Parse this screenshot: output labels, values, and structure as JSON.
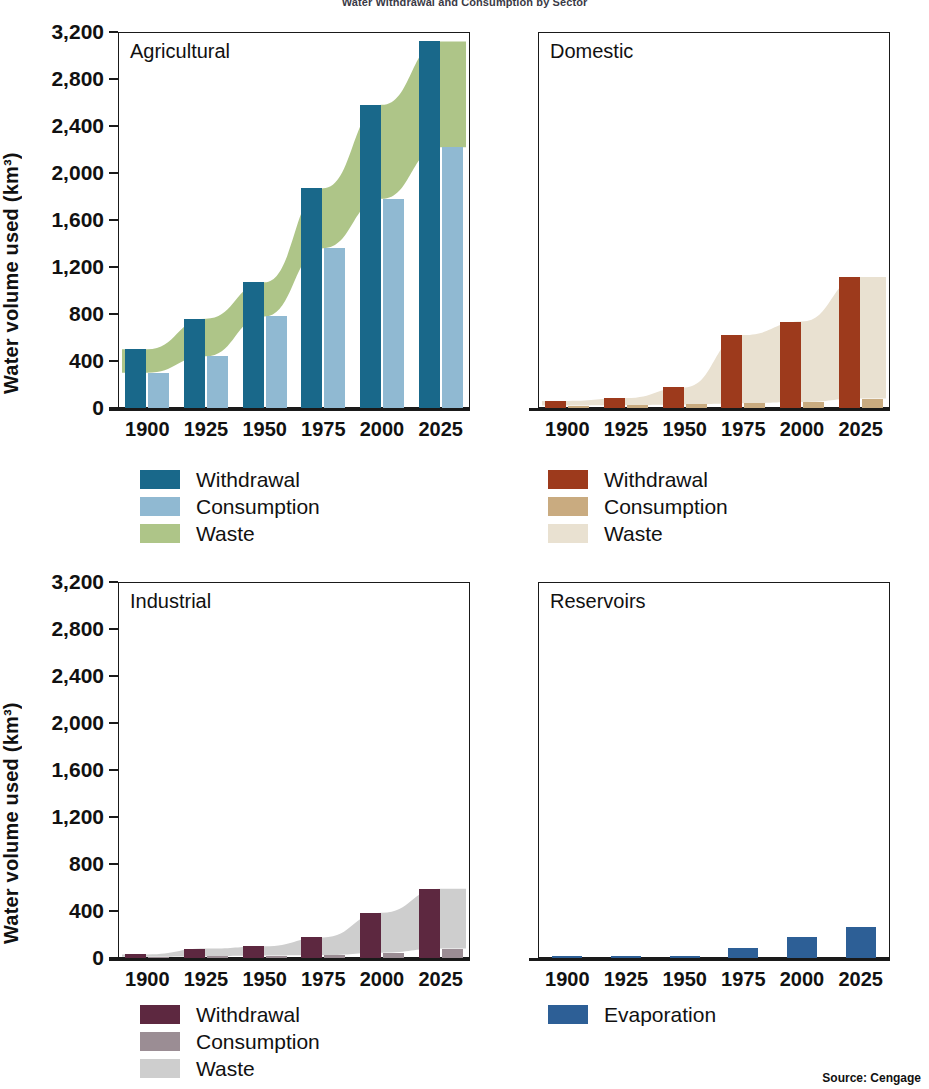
{
  "figure": {
    "title": "Water Withdrawal and Consumption by Sector",
    "source": "Source: Cengage",
    "y_axis_title": "Water volume used (km³)",
    "y_ticks": [
      "0",
      "400",
      "800",
      "1,200",
      "1,600",
      "2,000",
      "2,400",
      "2,800",
      "3,200"
    ],
    "x_ticks": [
      "1900",
      "1925",
      "1950",
      "1975",
      "2000",
      "2025"
    ]
  },
  "colors": {
    "agricultural_withdrawal": "#19688a",
    "agricultural_consumption": "#90b9d2",
    "agricultural_waste": "#aec588",
    "domestic_withdrawal": "#9d3a1c",
    "domestic_consumption": "#c9ab80",
    "domestic_waste": "#e9e1d1",
    "industrial_withdrawal": "#5d2840",
    "industrial_consumption": "#9b8d94",
    "industrial_waste": "#cecece",
    "reservoirs_evaporation": "#2d5f96",
    "axis": "#1a1a1a"
  },
  "panels": [
    {
      "id": "agricultural",
      "label": "Agricultural",
      "legend": [
        {
          "name": "withdrawal",
          "label": "Withdrawal",
          "color": "#19688a"
        },
        {
          "name": "consumption",
          "label": "Consumption",
          "color": "#90b9d2"
        },
        {
          "name": "waste",
          "label": "Waste",
          "color": "#aec588"
        }
      ]
    },
    {
      "id": "domestic",
      "label": "Domestic",
      "legend": [
        {
          "name": "withdrawal",
          "label": "Withdrawal",
          "color": "#9d3a1c"
        },
        {
          "name": "consumption",
          "label": "Consumption",
          "color": "#c9ab80"
        },
        {
          "name": "waste",
          "label": "Waste",
          "color": "#e9e1d1"
        }
      ]
    },
    {
      "id": "industrial",
      "label": "Industrial",
      "legend": [
        {
          "name": "withdrawal",
          "label": "Withdrawal",
          "color": "#5d2840"
        },
        {
          "name": "consumption",
          "label": "Consumption",
          "color": "#9b8d94"
        },
        {
          "name": "waste",
          "label": "Waste",
          "color": "#cecece"
        }
      ]
    },
    {
      "id": "reservoirs",
      "label": "Reservoirs",
      "legend": [
        {
          "name": "evaporation",
          "label": "Evaporation",
          "color": "#2d5f96"
        }
      ]
    }
  ],
  "chart_data": [
    {
      "type": "bar",
      "title": "Agricultural",
      "xlabel": "",
      "ylabel": "Water volume used (km³)",
      "ylim": [
        0,
        3200
      ],
      "grid": false,
      "legend_position": "below",
      "categories": [
        "1900",
        "1925",
        "1950",
        "1975",
        "2000",
        "2025"
      ],
      "series": [
        {
          "name": "Withdrawal",
          "color": "#19688a",
          "values": [
            500,
            760,
            1070,
            1870,
            2580,
            3120
          ]
        },
        {
          "name": "Consumption",
          "color": "#90b9d2",
          "values": [
            300,
            440,
            780,
            1360,
            1780,
            2220
          ]
        },
        {
          "name": "Waste",
          "color": "#aec588",
          "values": [
            200,
            320,
            290,
            510,
            800,
            900
          ],
          "render": "band",
          "band_upper": [
            500,
            760,
            1070,
            1870,
            2580,
            3120
          ],
          "band_lower": [
            300,
            440,
            780,
            1360,
            1780,
            2220
          ]
        }
      ]
    },
    {
      "type": "bar",
      "title": "Domestic",
      "xlabel": "",
      "ylabel": "Water volume used (km³)",
      "ylim": [
        0,
        3200
      ],
      "grid": false,
      "legend_position": "below",
      "categories": [
        "1900",
        "1925",
        "1950",
        "1975",
        "2000",
        "2025"
      ],
      "series": [
        {
          "name": "Withdrawal",
          "color": "#9d3a1c",
          "values": [
            60,
            85,
            175,
            620,
            735,
            1115
          ]
        },
        {
          "name": "Consumption",
          "color": "#c9ab80",
          "values": [
            20,
            25,
            30,
            40,
            50,
            80
          ]
        },
        {
          "name": "Waste",
          "color": "#e9e1d1",
          "values": [
            40,
            60,
            145,
            580,
            685,
            1035
          ],
          "render": "band",
          "band_upper": [
            60,
            85,
            175,
            620,
            735,
            1115
          ],
          "band_lower": [
            20,
            25,
            30,
            40,
            50,
            80
          ]
        }
      ]
    },
    {
      "type": "bar",
      "title": "Industrial",
      "xlabel": "",
      "ylabel": "Water volume used (km³)",
      "ylim": [
        0,
        3200
      ],
      "grid": false,
      "legend_position": "below",
      "categories": [
        "1900",
        "1925",
        "1950",
        "1975",
        "2000",
        "2025"
      ],
      "series": [
        {
          "name": "Withdrawal",
          "color": "#5d2840",
          "values": [
            30,
            80,
            100,
            175,
            385,
            590
          ]
        },
        {
          "name": "Consumption",
          "color": "#9b8d94",
          "values": [
            10,
            15,
            20,
            25,
            45,
            80
          ]
        },
        {
          "name": "Waste",
          "color": "#cecece",
          "values": [
            20,
            65,
            80,
            150,
            340,
            510
          ],
          "render": "band",
          "band_upper": [
            30,
            80,
            100,
            175,
            385,
            590
          ],
          "band_lower": [
            10,
            15,
            20,
            25,
            45,
            80
          ]
        }
      ]
    },
    {
      "type": "bar",
      "title": "Reservoirs",
      "xlabel": "",
      "ylabel": "",
      "ylim": [
        0,
        3200
      ],
      "grid": false,
      "legend_position": "below",
      "categories": [
        "1900",
        "1925",
        "1950",
        "1975",
        "2000",
        "2025"
      ],
      "series": [
        {
          "name": "Evaporation",
          "color": "#2d5f96",
          "values": [
            20,
            20,
            20,
            85,
            180,
            265
          ]
        }
      ]
    }
  ]
}
